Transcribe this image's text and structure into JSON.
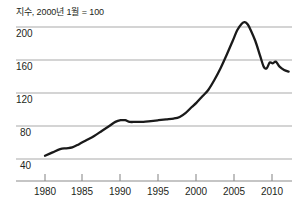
{
  "chart_data": {
    "type": "line",
    "title": "지수, 2000년 1월 = 100",
    "xlabel": "",
    "ylabel": "",
    "xlim": [
      1978.2,
      2012.8
    ],
    "ylim": [
      24,
      216
    ],
    "grid": true,
    "legend": false,
    "y_ticks": [
      200,
      160,
      120,
      80,
      40
    ],
    "y_tick_labels": [
      "200",
      "160",
      "120",
      "80",
      "40"
    ],
    "x_ticks": [
      1980,
      1985,
      1990,
      1995,
      2000,
      2005,
      2010
    ],
    "x_tick_labels": [
      "1980",
      "1985",
      "1990",
      "1995",
      "2000",
      "2005",
      "2010"
    ],
    "series": [
      {
        "name": "주택가격지수",
        "color": "#1a1a1a",
        "x": [
          1980.0,
          1981.0,
          1982.0,
          1982.8,
          1983.6,
          1984.5,
          1985.5,
          1986.5,
          1987.5,
          1988.5,
          1989.3,
          1990.0,
          1990.6,
          1991.2,
          1992.0,
          1993.0,
          1994.0,
          1995.0,
          1996.0,
          1997.0,
          1997.8,
          1998.6,
          1999.4,
          2000.0,
          2000.8,
          2001.6,
          2002.4,
          2003.2,
          2004.0,
          2004.8,
          2005.4,
          2006.0,
          2006.4,
          2006.8,
          2007.2,
          2007.8,
          2008.4,
          2008.9,
          2009.3,
          2009.7,
          2010.1,
          2010.5,
          2011.0,
          2011.6,
          2012.2
        ],
        "y": [
          44,
          48,
          52,
          53,
          54,
          58,
          63,
          68,
          74,
          80,
          85,
          87,
          87,
          85,
          85,
          85,
          86,
          87,
          88,
          89,
          91,
          96,
          103,
          108,
          116,
          124,
          136,
          150,
          166,
          183,
          196,
          204,
          206,
          203,
          196,
          183,
          166,
          152,
          150,
          157,
          156,
          158,
          152,
          148,
          146
        ]
      }
    ]
  }
}
